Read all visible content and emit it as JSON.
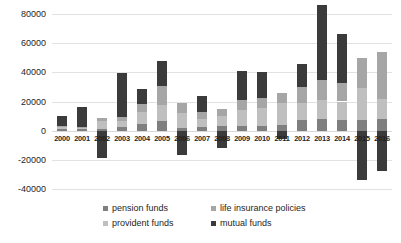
{
  "chart_data": {
    "type": "bar",
    "title": "",
    "subtitle": "",
    "xlabel": "",
    "ylabel": "",
    "stacked": true,
    "grid": true,
    "legend_position": "bottom",
    "ylim": [
      -40000,
      80000
    ],
    "yticks": [
      80000,
      60000,
      40000,
      20000,
      0,
      -20000,
      -40000
    ],
    "ytick_labels": [
      "80000",
      "60000",
      "40000",
      "20000",
      "0",
      "-20000",
      "-40000"
    ],
    "categories": [
      "2000",
      "2001",
      "2002",
      "2003",
      "2004",
      "2005",
      "2006",
      "2007",
      "2008",
      "2009",
      "2010",
      "2011",
      "2012",
      "2013",
      "2014",
      "2015",
      "2016"
    ],
    "series": [
      {
        "name": "pension funds",
        "color": "#7f7f7f",
        "values": [
          1200,
          900,
          1000,
          2500,
          4500,
          6500,
          2000,
          2500,
          3500,
          3000,
          3500,
          4000,
          7000,
          8000,
          7000,
          7500,
          8000
        ]
      },
      {
        "name": "provident funds",
        "color": "#bfbfbf",
        "values": [
          1000,
          800,
          5500,
          4000,
          8000,
          11000,
          10000,
          5500,
          6500,
          11000,
          12000,
          15000,
          12000,
          13000,
          13000,
          22000,
          14000
        ]
      },
      {
        "name": "life insurance policies",
        "color": "#a6a6a6",
        "values": [
          800,
          700,
          2000,
          3000,
          6000,
          13000,
          7000,
          4500,
          5000,
          7000,
          7000,
          7000,
          11000,
          14000,
          13000,
          20000,
          32000
        ]
      },
      {
        "name": "mutual funds",
        "color": "#3b3b3b",
        "values": [
          7000,
          14000,
          -19000,
          30000,
          10000,
          17000,
          -17000,
          11500,
          -12000,
          20000,
          18000,
          -6000,
          16000,
          51000,
          33000,
          -34000,
          -28000
        ]
      }
    ]
  },
  "legend": {
    "items": [
      {
        "label": "pension funds",
        "color": "#7f7f7f"
      },
      {
        "label": "life insurance policies",
        "color": "#a6a6a6"
      },
      {
        "label": "provident funds",
        "color": "#bfbfbf"
      },
      {
        "label": "mutual funds",
        "color": "#3b3b3b"
      }
    ]
  }
}
